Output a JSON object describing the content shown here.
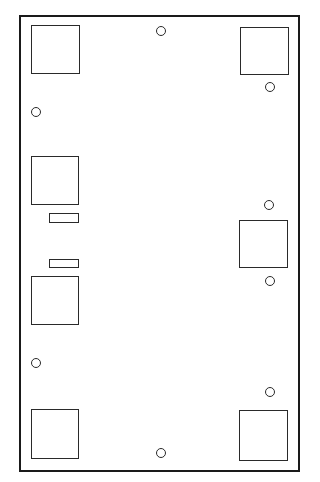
{
  "diagram": {
    "type": "panel-layout",
    "stroke_color": "#1a1a1a",
    "background": "#ffffff",
    "board": {
      "x": 19,
      "y": 15,
      "w": 281,
      "h": 457
    },
    "square_pads": [
      {
        "id": "pad-top-left",
        "x": 31,
        "y": 25,
        "w": 49,
        "h": 49
      },
      {
        "id": "pad-top-right",
        "x": 240,
        "y": 27,
        "w": 49,
        "h": 48
      },
      {
        "id": "pad-mid-left-upper",
        "x": 31,
        "y": 156,
        "w": 48,
        "h": 49
      },
      {
        "id": "pad-mid-right",
        "x": 239,
        "y": 220,
        "w": 49,
        "h": 48
      },
      {
        "id": "pad-mid-left-lower",
        "x": 31,
        "y": 276,
        "w": 48,
        "h": 49
      },
      {
        "id": "pad-bottom-left",
        "x": 31,
        "y": 409,
        "w": 48,
        "h": 50
      },
      {
        "id": "pad-bottom-right",
        "x": 239,
        "y": 410,
        "w": 49,
        "h": 51
      }
    ],
    "slots": [
      {
        "id": "slot-upper",
        "x": 49,
        "y": 213,
        "w": 30,
        "h": 10
      },
      {
        "id": "slot-lower",
        "x": 49,
        "y": 259,
        "w": 30,
        "h": 9
      }
    ],
    "holes": [
      {
        "id": "hole-top-center",
        "cx": 161,
        "cy": 31,
        "r": 5
      },
      {
        "id": "hole-top-right",
        "cx": 270,
        "cy": 87,
        "r": 5
      },
      {
        "id": "hole-left-upper",
        "cx": 36,
        "cy": 112,
        "r": 5
      },
      {
        "id": "hole-right-mid-upper",
        "cx": 269,
        "cy": 205,
        "r": 5
      },
      {
        "id": "hole-right-mid-lower",
        "cx": 270,
        "cy": 281,
        "r": 5
      },
      {
        "id": "hole-left-lower",
        "cx": 36,
        "cy": 363,
        "r": 5
      },
      {
        "id": "hole-right-lower",
        "cx": 270,
        "cy": 392,
        "r": 5
      },
      {
        "id": "hole-bottom-center",
        "cx": 161,
        "cy": 453,
        "r": 5
      }
    ]
  }
}
